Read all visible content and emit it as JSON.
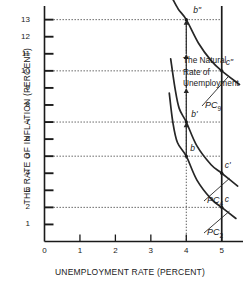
{
  "chart_data": {
    "type": "line",
    "title": "",
    "xlabel": "UNEMPLOYMENT RATE (PERCENT)",
    "ylabel": "THE RATE OF INFLATION (PERCENT)",
    "xlim": [
      0,
      5.6
    ],
    "ylim": [
      0,
      13.8
    ],
    "x_ticks": [
      "0",
      "1",
      "2",
      "3",
      "4",
      "5"
    ],
    "x_tick_values": [
      0,
      1,
      2,
      3,
      4,
      5
    ],
    "y_ticks": [
      "1",
      "2",
      "3",
      "4",
      "5",
      "6",
      "7",
      "8",
      "9",
      "10",
      "11",
      "12",
      "13"
    ],
    "y_tick_values": [
      1,
      2,
      3,
      4,
      5,
      6,
      7,
      8,
      9,
      10,
      11,
      12,
      13
    ],
    "grid": false,
    "legend": "inline-curve-labels",
    "series": [
      {
        "name": "PC2",
        "label": "PC",
        "label_sub": "2",
        "points": [
          [
            3.52,
            8.7
          ],
          [
            3.62,
            7.0
          ],
          [
            3.75,
            5.8
          ],
          [
            4.0,
            5.0
          ],
          [
            4.3,
            3.6
          ],
          [
            4.7,
            2.5
          ],
          [
            5.0,
            2.0
          ],
          [
            5.4,
            1.35
          ]
        ]
      },
      {
        "name": "PC4",
        "label": "PC",
        "label_sub": "4",
        "points": [
          [
            3.56,
            10.7
          ],
          [
            3.68,
            9.0
          ],
          [
            3.8,
            7.8
          ],
          [
            4.0,
            7.0
          ],
          [
            4.3,
            5.6
          ],
          [
            4.7,
            4.5
          ],
          [
            5.0,
            4.0
          ],
          [
            5.45,
            3.25
          ]
        ]
      },
      {
        "name": "PC9",
        "label": "PC",
        "label_sub": "9",
        "points": [
          [
            3.62,
            14.2
          ],
          [
            3.78,
            13.6
          ],
          [
            4.0,
            13.0
          ],
          [
            4.35,
            11.6
          ],
          [
            4.7,
            10.6
          ],
          [
            5.0,
            10.0
          ],
          [
            5.5,
            9.2
          ]
        ]
      }
    ],
    "points": [
      {
        "name": "b",
        "label": "b",
        "x": 4,
        "y": 5,
        "on_curve": "PC2"
      },
      {
        "name": "b-prime",
        "label": "b'",
        "x": 4,
        "y": 7,
        "on_curve": "PC4"
      },
      {
        "name": "b-double-prime",
        "label": "b\"",
        "x": 4,
        "y": 13,
        "on_curve": "PC9"
      },
      {
        "name": "c",
        "label": "c",
        "x": 5,
        "y": 2,
        "on_curve": "PC2"
      },
      {
        "name": "c-prime",
        "label": "c'",
        "x": 5,
        "y": 4,
        "on_curve": "PC4"
      },
      {
        "name": "c-double-prime",
        "label": "c\"",
        "x": 5,
        "y": 10,
        "on_curve": "PC9"
      }
    ],
    "annotations": [
      {
        "name": "natural-rate-line",
        "type": "vline",
        "x": 5,
        "text": "The Natural\nRate of\nUnemployment",
        "lines": [
          "The Natural",
          "Rate of",
          "Unemployment"
        ]
      }
    ],
    "guide_lines": {
      "horizontal_dotted_y": [
        2,
        5,
        7,
        10,
        13
      ],
      "vertical_dotted_x": [
        4
      ]
    },
    "arrows": {
      "name": "inflation-acceleration-arrows",
      "at_x": 4,
      "direction": "up",
      "segments": [
        [
          5,
          7
        ],
        [
          7,
          9
        ],
        [
          9,
          11
        ],
        [
          11,
          13
        ]
      ]
    }
  },
  "axis": {
    "y_title": "THE RATE OF INFLATION (PERCENT)",
    "x_title": "UNEMPLOYMENT RATE (PERCENT)",
    "origin_label": "0"
  },
  "natural_rate": {
    "line1": "The Natural",
    "line2": "Rate of",
    "line3": "Unemployment"
  },
  "colors": {
    "ink": "#1a1a1a",
    "curve": "#2b2b2b",
    "guide": "#555555",
    "background": "#ffffff"
  }
}
